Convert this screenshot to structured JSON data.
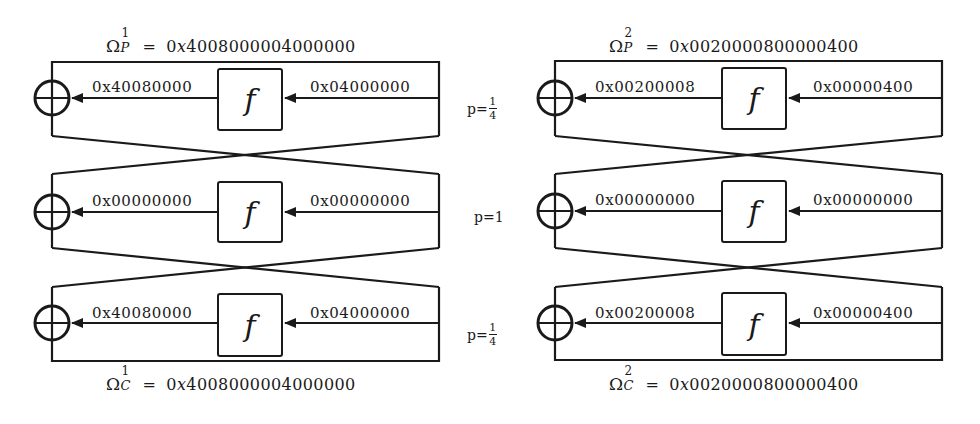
{
  "diagram": {
    "type": "feistel-differential-characteristic",
    "line_color": "#1a1a1a",
    "background": "#ffffff",
    "function_label": "f",
    "characteristics": [
      {
        "id": "1",
        "input": {
          "symbol": "Ω",
          "sup": "1",
          "sub": "P",
          "equals": "=",
          "prefix": "0",
          "x": "x",
          "digits": "4008000004000000"
        },
        "output": {
          "symbol": "Ω",
          "sup": "1",
          "sub": "C",
          "equals": "=",
          "prefix": "0",
          "x": "x",
          "digits": "4008000004000000"
        },
        "rounds": [
          {
            "f_out": "0x40080000",
            "f_in": "0x04000000"
          },
          {
            "f_out": "0x00000000",
            "f_in": "0x00000000"
          },
          {
            "f_out": "0x40080000",
            "f_in": "0x04000000"
          }
        ]
      },
      {
        "id": "2",
        "input": {
          "symbol": "Ω",
          "sup": "2",
          "sub": "P",
          "equals": "=",
          "prefix": "0",
          "x": "x",
          "digits": "0020000800000400"
        },
        "output": {
          "symbol": "Ω",
          "sup": "2",
          "sub": "C",
          "equals": "=",
          "prefix": "0",
          "x": "x",
          "digits": "0020000800000400"
        },
        "rounds": [
          {
            "f_out": "0x00200008",
            "f_in": "0x00000400"
          },
          {
            "f_out": "0x00000000",
            "f_in": "0x00000000"
          },
          {
            "f_out": "0x00200008",
            "f_in": "0x00000400"
          }
        ]
      }
    ],
    "probabilities": [
      {
        "label": "p=",
        "num": "1",
        "den": "4"
      },
      {
        "label": "p=1"
      },
      {
        "label": "p=",
        "num": "1",
        "den": "4"
      }
    ]
  }
}
